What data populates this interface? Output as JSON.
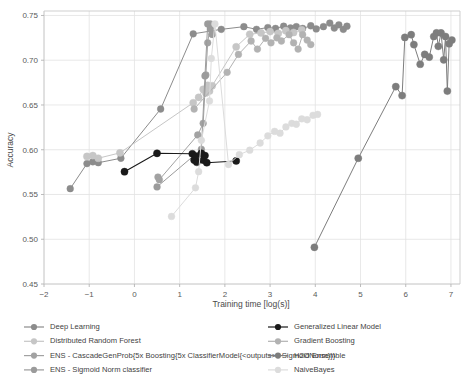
{
  "figure": {
    "width": 474,
    "height": 378,
    "background": "#ffffff"
  },
  "chart_data": {
    "type": "line",
    "title": "",
    "xlabel": "Training time [log(s)]",
    "ylabel": "Accuracy",
    "xlim": [
      -2,
      7.2
    ],
    "ylim": [
      0.45,
      0.755
    ],
    "xticks": [
      -2,
      -1,
      0,
      1,
      2,
      3,
      4,
      5,
      6,
      7
    ],
    "xticklabels": [
      "−2",
      "−1",
      "0",
      "1",
      "2",
      "3",
      "4",
      "5",
      "6",
      "7"
    ],
    "yticks": [
      0.45,
      0.5,
      0.55,
      0.6,
      0.65,
      0.7,
      0.75
    ],
    "yticklabels": [
      "0.45",
      "0.50",
      "0.55",
      "0.60",
      "0.65",
      "0.70",
      "0.75"
    ],
    "grid": true,
    "grid_color": "#e2e2e2",
    "legend_position": "below-plot-two-columns",
    "marker": "circle",
    "series": [
      {
        "name": "Deep Learning",
        "color": "#8c8c8c",
        "linewidth": 1.0,
        "markersize": 3.4,
        "points": [
          [
            -1.42,
            0.5565
          ],
          [
            -1.05,
            0.5845
          ],
          [
            -0.92,
            0.5865
          ],
          [
            -0.8,
            0.5855
          ],
          [
            -0.3,
            0.5905
          ],
          [
            0.58,
            0.6455
          ],
          [
            1.3,
            0.7295
          ],
          [
            1.92,
            0.7345
          ],
          [
            2.42,
            0.7375
          ],
          [
            2.7,
            0.7345
          ],
          [
            2.95,
            0.7365
          ],
          [
            3.12,
            0.7355
          ],
          [
            3.3,
            0.738
          ],
          [
            3.45,
            0.736
          ],
          [
            3.58,
            0.7375
          ],
          [
            3.72,
            0.7355
          ],
          [
            3.9,
            0.7385
          ],
          [
            4.02,
            0.735
          ],
          [
            4.18,
            0.7375
          ],
          [
            4.32,
            0.7415
          ],
          [
            4.42,
            0.736
          ],
          [
            4.52,
            0.7395
          ],
          [
            4.62,
            0.7345
          ],
          [
            4.7,
            0.738
          ]
        ]
      },
      {
        "name": "Distributed Random Forest",
        "color": "#c6c6c6",
        "linewidth": 1.0,
        "markersize": 3.6,
        "points": [
          [
            -1.05,
            0.5925
          ],
          [
            -0.92,
            0.5935
          ],
          [
            -0.8,
            0.5905
          ],
          [
            -0.32,
            0.5965
          ],
          [
            1.3,
            0.6525
          ],
          [
            1.42,
            0.6585
          ],
          [
            1.52,
            0.6675
          ],
          [
            1.58,
            0.6635
          ],
          [
            1.62,
            0.672
          ],
          [
            1.66,
            0.6655
          ],
          [
            1.72,
            0.6715
          ],
          [
            2.25,
            0.715
          ],
          [
            2.55,
            0.729
          ],
          [
            2.8,
            0.7305
          ],
          [
            3.0,
            0.732
          ],
          [
            3.18,
            0.73
          ],
          [
            3.35,
            0.733
          ],
          [
            3.52,
            0.731
          ],
          [
            3.7,
            0.734
          ]
        ]
      },
      {
        "name": "ENS - CascadeGenProb{5x Boosting{5x ClassifierModel{<outputs>x SigmoidNorm}}}",
        "color": "#a2a2a2",
        "linewidth": 1.0,
        "markersize": 3.4,
        "points": [
          [
            0.52,
            0.5695
          ],
          [
            0.55,
            0.5665
          ],
          [
            1.4,
            0.6165
          ],
          [
            1.52,
            0.6295
          ],
          [
            1.58,
            0.6835
          ],
          [
            1.62,
            0.7195
          ],
          [
            1.68,
            0.7405
          ],
          [
            1.72,
            0.729
          ]
        ]
      },
      {
        "name": "ENS - Sigmoid Norm classifier",
        "color": "#9b9b9b",
        "linewidth": 1.0,
        "markersize": 3.4,
        "points": [
          [
            0.5,
            0.5585
          ],
          [
            1.48,
            0.6005
          ],
          [
            1.56,
            0.6825
          ],
          [
            1.62,
            0.7405
          ],
          [
            1.68,
            0.735
          ],
          [
            1.72,
            0.729
          ]
        ]
      },
      {
        "name": "Generalized Linear Model",
        "color": "#1a1a1a",
        "linewidth": 1.1,
        "markersize": 3.6,
        "points": [
          [
            -0.22,
            0.5755
          ],
          [
            0.5,
            0.596
          ],
          [
            1.28,
            0.5955
          ],
          [
            1.32,
            0.5885
          ],
          [
            1.35,
            0.593
          ],
          [
            1.38,
            0.586
          ],
          [
            1.48,
            0.596
          ],
          [
            1.52,
            0.5885
          ],
          [
            1.56,
            0.5935
          ],
          [
            1.6,
            0.5855
          ],
          [
            2.25,
            0.5875
          ]
        ]
      },
      {
        "name": "Gradient Boosting",
        "color": "#b2b2b2",
        "linewidth": 1.0,
        "markersize": 3.4,
        "points": [
          [
            1.32,
            0.6455
          ],
          [
            2.05,
            0.6865
          ],
          [
            2.3,
            0.7065
          ],
          [
            2.58,
            0.7215
          ],
          [
            2.72,
            0.7125
          ],
          [
            2.9,
            0.7245
          ],
          [
            3.02,
            0.7195
          ],
          [
            3.15,
            0.725
          ],
          [
            3.25,
            0.7215
          ],
          [
            3.42,
            0.7285
          ],
          [
            3.52,
            0.7195
          ],
          [
            3.62,
            0.7125
          ],
          [
            3.72,
            0.7285
          ],
          [
            3.82,
            0.7225
          ],
          [
            3.9,
            0.7175
          ]
        ]
      },
      {
        "name": "H2O Ensemble",
        "color": "#7d7d7d",
        "linewidth": 1.0,
        "markersize": 3.6,
        "points": [
          [
            3.98,
            0.491
          ],
          [
            4.95,
            0.5905
          ],
          [
            5.78,
            0.6705
          ],
          [
            5.92,
            0.6605
          ],
          [
            5.98,
            0.7255
          ],
          [
            6.12,
            0.7285
          ],
          [
            6.18,
            0.7175
          ],
          [
            6.32,
            0.6955
          ],
          [
            6.42,
            0.7065
          ],
          [
            6.52,
            0.7035
          ],
          [
            6.62,
            0.7265
          ],
          [
            6.68,
            0.7305
          ],
          [
            6.72,
            0.7155
          ],
          [
            6.78,
            0.7305
          ],
          [
            6.84,
            0.7005
          ],
          [
            6.88,
            0.7265
          ],
          [
            6.92,
            0.6655
          ],
          [
            6.96,
            0.7185
          ],
          [
            7.02,
            0.7225
          ]
        ]
      },
      {
        "name": "NaiveBayes",
        "color": "#dcdcdc",
        "linewidth": 1.0,
        "markersize": 3.4,
        "points": [
          [
            0.82,
            0.5255
          ],
          [
            1.35,
            0.5575
          ],
          [
            1.42,
            0.5755
          ],
          [
            1.48,
            0.6105
          ],
          [
            1.66,
            0.6545
          ],
          [
            1.7,
            0.702
          ],
          [
            1.78,
            0.7405
          ],
          [
            2.08,
            0.5835
          ],
          [
            2.32,
            0.5945
          ],
          [
            2.55,
            0.5995
          ],
          [
            2.78,
            0.6075
          ],
          [
            2.95,
            0.6155
          ],
          [
            3.1,
            0.6205
          ],
          [
            3.22,
            0.6185
          ],
          [
            3.35,
            0.6255
          ],
          [
            3.48,
            0.6295
          ],
          [
            3.58,
            0.6285
          ],
          [
            3.7,
            0.6345
          ],
          [
            3.82,
            0.6335
          ],
          [
            3.95,
            0.6385
          ],
          [
            4.05,
            0.6395
          ]
        ]
      }
    ]
  },
  "legend": {
    "column1": [
      {
        "label": "Deep Learning",
        "color": "#8c8c8c"
      },
      {
        "label": "Distributed Random Forest",
        "color": "#c6c6c6"
      },
      {
        "label": "ENS - CascadeGenProb{5x Boosting{5x ClassifierModel{<outputs>x SigmoidNorm}}}",
        "color": "#a2a2a2"
      },
      {
        "label": "ENS - Sigmoid Norm classifier",
        "color": "#9b9b9b"
      }
    ],
    "column2": [
      {
        "label": "Generalized Linear Model",
        "color": "#1a1a1a"
      },
      {
        "label": "Gradient Boosting",
        "color": "#b2b2b2"
      },
      {
        "label": "H2O Ensemble",
        "color": "#7d7d7d"
      },
      {
        "label": "NaiveBayes",
        "color": "#dcdcdc"
      }
    ]
  }
}
